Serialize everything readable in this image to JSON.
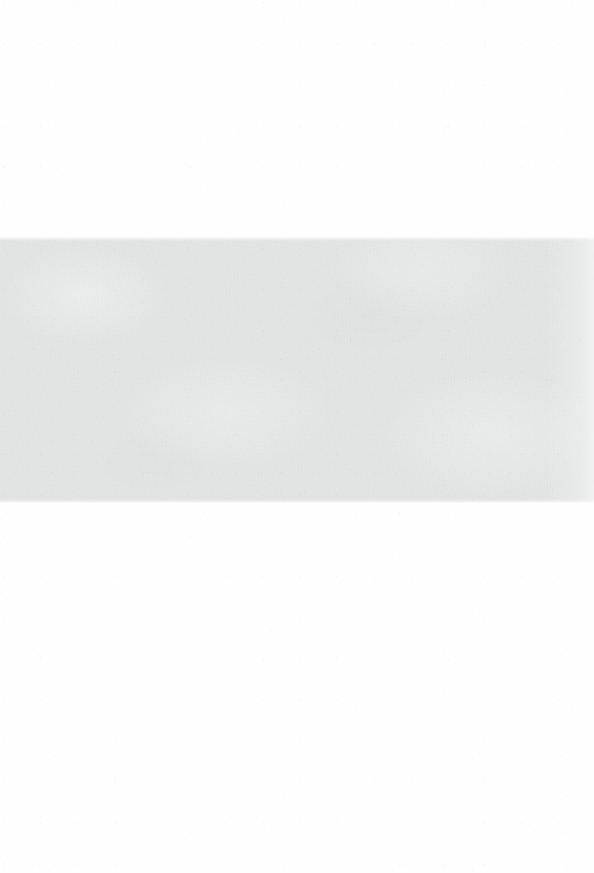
{
  "page": {
    "kind": "blank-scanned-page",
    "width": 594,
    "height": 873,
    "background_color": "#fefefe",
    "visible_text": "",
    "caption": ""
  },
  "band": {
    "label": "",
    "color": "#e3e4e4",
    "top": 237,
    "left": 0,
    "width": 594,
    "height": 266
  },
  "regions": {
    "top_margin": {
      "label": "",
      "top": 0,
      "height": 237,
      "color": "#fefefe"
    },
    "bottom_margin": {
      "label": "",
      "top": 503,
      "height": 370,
      "color": "#fefefe"
    }
  }
}
